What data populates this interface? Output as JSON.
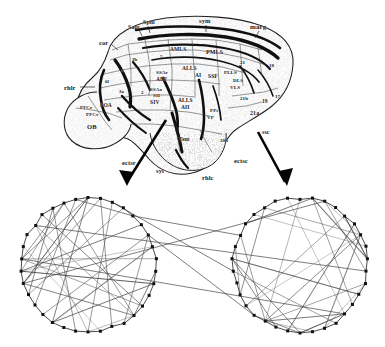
{
  "figure": {
    "panels": [
      "brain-surface-map",
      "circular-graph-left",
      "circular-graph-right"
    ]
  },
  "brain_map": {
    "caption": "Lateral view of cat cerebral cortex with sulci and cytoarchitectonic area labels",
    "sulci_labels": [
      {
        "text": "Spm",
        "x": 143,
        "y": 19
      },
      {
        "text": "Sam",
        "x": 128,
        "y": 24
      },
      {
        "text": "sym",
        "x": 199,
        "y": 18
      },
      {
        "text": "marg",
        "x": 250,
        "y": 24
      },
      {
        "text": "cor",
        "x": 99,
        "y": 40
      },
      {
        "text": "rhlr",
        "x": 67,
        "y": 85
      },
      {
        "text": "ectsr",
        "x": 126,
        "y": 160
      },
      {
        "text": "syl",
        "x": 158,
        "y": 168
      },
      {
        "text": "rhlc",
        "x": 205,
        "y": 175
      },
      {
        "text": "ectsc",
        "x": 236,
        "y": 158
      },
      {
        "text": "ssc",
        "x": 264,
        "y": 129
      }
    ],
    "area_labels": [
      {
        "text": "AMLS",
        "x": 170,
        "y": 47
      },
      {
        "text": "PMLS",
        "x": 208,
        "y": 49
      },
      {
        "text": "ALLS",
        "x": 184,
        "y": 66
      },
      {
        "text": "AI",
        "x": 193,
        "y": 73
      },
      {
        "text": "SSF",
        "x": 209,
        "y": 73
      },
      {
        "text": "PLLS",
        "x": 226,
        "y": 71
      },
      {
        "text": "DLS",
        "x": 235,
        "y": 78
      },
      {
        "text": "VLS",
        "x": 231,
        "y": 85
      },
      {
        "text": "SSAr",
        "x": 159,
        "y": 70
      },
      {
        "text": "AEF",
        "x": 158,
        "y": 77
      },
      {
        "text": "SSAo",
        "x": 152,
        "y": 87
      },
      {
        "text": "SII",
        "x": 153,
        "y": 93
      },
      {
        "text": "SIV",
        "x": 152,
        "y": 100
      },
      {
        "text": "ALLS",
        "x": 180,
        "y": 98
      },
      {
        "text": "AII",
        "x": 182,
        "y": 105
      },
      {
        "text": "PFCr",
        "x": 83,
        "y": 105
      },
      {
        "text": "POA",
        "x": 103,
        "y": 103
      },
      {
        "text": "OB",
        "x": 89,
        "y": 124
      },
      {
        "text": "Tem",
        "x": 181,
        "y": 137
      },
      {
        "text": "PFCv",
        "x": 88,
        "y": 112
      },
      {
        "text": "PPs",
        "x": 212,
        "y": 108
      },
      {
        "text": "VP",
        "x": 208,
        "y": 115
      },
      {
        "text": "20b",
        "x": 222,
        "y": 138
      },
      {
        "text": "21a",
        "x": 252,
        "y": 110
      },
      {
        "text": "21b",
        "x": 241,
        "y": 96
      },
      {
        "text": "19",
        "x": 263,
        "y": 99
      },
      {
        "text": "17",
        "x": 276,
        "y": 94
      },
      {
        "text": "18",
        "x": 270,
        "y": 63
      },
      {
        "text": "21",
        "x": 241,
        "y": 60
      },
      {
        "text": "3b",
        "x": 133,
        "y": 57
      },
      {
        "text": "3a",
        "x": 120,
        "y": 89
      },
      {
        "text": "2",
        "x": 141,
        "y": 90
      },
      {
        "text": "6l",
        "x": 106,
        "y": 79
      },
      {
        "text": "4",
        "x": 121,
        "y": 68
      },
      {
        "text": "5",
        "x": 160,
        "y": 54
      }
    ]
  },
  "arrows": [
    {
      "name": "arrow-to-left-graph",
      "x1": 166,
      "y1": 120,
      "x2": 124,
      "y2": 186
    },
    {
      "name": "arrow-to-right-graph",
      "x1": 258,
      "y1": 132,
      "x2": 287,
      "y2": 186
    }
  ],
  "graphs": {
    "left": {
      "label": "left-hemisphere-circular-graph",
      "cx": 88,
      "cy": 265,
      "r": 67,
      "node_count": 34
    },
    "right": {
      "label": "right-hemisphere-circular-graph",
      "cx": 300,
      "cy": 265,
      "r": 67,
      "node_count": 34
    },
    "interhemispheric_edges": 6,
    "edge_color": "#4a4a4a",
    "node_color": "#111111"
  },
  "colors": {
    "ink": "#1b1b1b",
    "background": "#ffffff",
    "graph_line": "#5a5a5a",
    "arrow": "#050505"
  }
}
